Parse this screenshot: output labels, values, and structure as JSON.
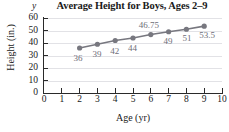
{
  "chart_data": {
    "type": "line",
    "title": "Average Height for Boys, Ages 2–9",
    "xlabel": "Age (yr)",
    "ylabel": "Height (in.)",
    "x_axis_letter": "",
    "y_axis_letter": "y",
    "x": [
      2,
      3,
      4,
      5,
      6,
      7,
      8,
      9
    ],
    "values": [
      36,
      39,
      42,
      44,
      46.75,
      49,
      51,
      53.5
    ],
    "point_labels": [
      "36",
      "39",
      "42",
      "44",
      "46.75",
      "49",
      "51",
      "53.5"
    ],
    "xlim": [
      0,
      10
    ],
    "ylim": [
      0,
      60
    ],
    "x_ticks": [
      "0",
      "1",
      "2",
      "3",
      "4",
      "5",
      "6",
      "7",
      "8",
      "9",
      "10"
    ],
    "y_ticks": [
      "0",
      "10",
      "20",
      "30",
      "40",
      "50",
      "60"
    ],
    "grid": true,
    "legend": null,
    "series_color": "#77777f",
    "grid_color": "#e2e2e6",
    "axis_color": "#2a2a2a",
    "label_color": "#6e6e78"
  }
}
